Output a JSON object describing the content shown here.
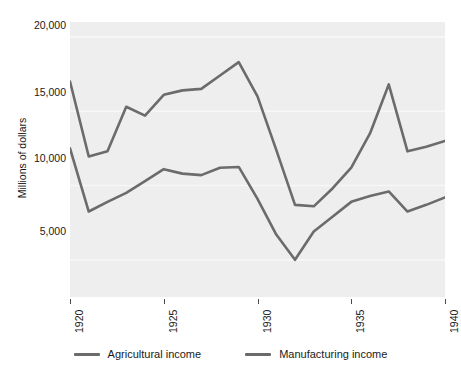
{
  "chart_data": {
    "type": "line",
    "title": "",
    "xlabel": "",
    "ylabel": "Millions of dollars",
    "xlim": [
      1920,
      1940
    ],
    "ylim": [
      2500,
      21000
    ],
    "yticks": [
      20000,
      15000,
      10000,
      5000
    ],
    "ytick_labels": [
      "20,000",
      "15,000",
      "10,000",
      "5,000"
    ],
    "xticks": [
      1920,
      1925,
      1930,
      1935,
      1940
    ],
    "xtick_labels": [
      "1920",
      "1925",
      "1930",
      "1935",
      "1940"
    ],
    "grid": true,
    "grid_color": "#f7f7f7",
    "plot_background": "#eeeeee",
    "legend_position": "bottom-center",
    "line_color": "#6b6b6b",
    "x": [
      1920,
      1921,
      1922,
      1923,
      1924,
      1925,
      1926,
      1927,
      1928,
      1929,
      1930,
      1931,
      1932,
      1933,
      1934,
      1935,
      1936,
      1937,
      1938,
      1939,
      1940
    ],
    "series": [
      {
        "name": "Agricultural income",
        "color": "#6b6b6b",
        "values": [
          12500,
          8250,
          8900,
          9500,
          10300,
          11100,
          10800,
          10700,
          11200,
          11250,
          9100,
          6700,
          5000,
          6900,
          7900,
          8900,
          9300,
          9600,
          8250,
          8700,
          9200
        ]
      },
      {
        "name": "Manufacturing income",
        "color": "#6b6b6b",
        "values": [
          17000,
          11950,
          12300,
          15300,
          14700,
          16100,
          16400,
          16500,
          17400,
          18300,
          16000,
          12400,
          8700,
          8600,
          9800,
          11200,
          13500,
          16800,
          12300,
          12600,
          13000
        ]
      }
    ]
  },
  "legend": {
    "items": [
      {
        "label": "Agricultural income"
      },
      {
        "label": "Manufacturing income"
      }
    ]
  }
}
